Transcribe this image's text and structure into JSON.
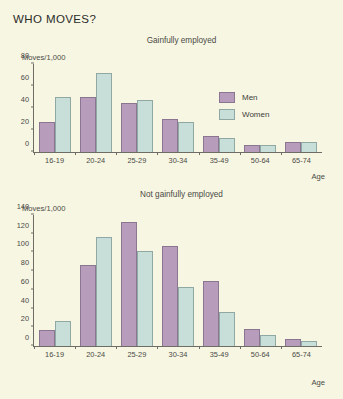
{
  "title": "WHO MOVES?",
  "legend": {
    "men_label": "Men",
    "women_label": "Women",
    "men_color": "#b79cbb",
    "women_color": "#c8dfd9"
  },
  "background_color": "#f7f6e2",
  "chart_data": [
    {
      "type": "bar",
      "title": "Gainfully employed",
      "xlabel": "Age",
      "ylabel": "Moves/1,000",
      "categories": [
        "16-19",
        "20-24",
        "25-29",
        "30-34",
        "35-49",
        "50-64",
        "65-74"
      ],
      "series": [
        {
          "name": "Men",
          "values": [
            27,
            50,
            45,
            30,
            15,
            6,
            9
          ]
        },
        {
          "name": "Women",
          "values": [
            50,
            72,
            47,
            27,
            13,
            6,
            9
          ]
        }
      ],
      "yticks": [
        0,
        20,
        40,
        60,
        80
      ],
      "ylim": [
        0,
        80
      ],
      "grid": false,
      "legend_position": "top-right"
    },
    {
      "type": "bar",
      "title": "Not gainfully employed",
      "xlabel": "Age",
      "ylabel": "Moves/1,000",
      "categories": [
        "16-19",
        "20-24",
        "25-29",
        "30-34",
        "35-49",
        "50-64",
        "65-74"
      ],
      "series": [
        {
          "name": "Men",
          "values": [
            17,
            87,
            133,
            107,
            69,
            18,
            7
          ]
        },
        {
          "name": "Women",
          "values": [
            27,
            116,
            102,
            63,
            36,
            12,
            5
          ]
        }
      ],
      "yticks": [
        0,
        20,
        40,
        60,
        80,
        100,
        120,
        140
      ],
      "ylim": [
        0,
        140
      ],
      "grid": false,
      "legend_position": "none"
    }
  ]
}
